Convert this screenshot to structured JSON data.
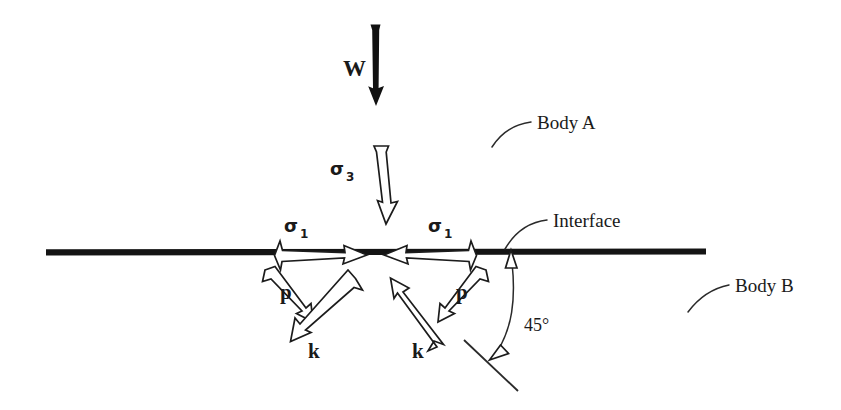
{
  "figure": {
    "background_color": "#ffffff",
    "ink_color": "#1a1a1a"
  },
  "labels": {
    "weight": "W",
    "sigma_symbol": "σ",
    "sigma3_sub": "3",
    "sigma1_sub_left": "1",
    "sigma1_sub_right": "1",
    "p_left": "p",
    "p_right": "p",
    "k_left": "k",
    "k_right": "k",
    "angle": "45°",
    "body_a": "Body A",
    "body_b": "Body B",
    "interface": "Interface"
  },
  "annotations": {
    "body_a_leader": "curved-leader-line",
    "body_b_leader": "curved-leader-line",
    "interface_leader": "curved-leader-line",
    "angle_arc": "double-headed-curved-arc"
  },
  "elements": {
    "weight_arrow": "solid-down-arrow",
    "sigma3_arrow": "hollow-down-arrow",
    "sigma1_left_arrow": "hollow-right-arrow",
    "sigma1_right_arrow": "hollow-left-arrow",
    "p_left_arrow": "hollow-diagonal-arrow",
    "k_left_arrow": "hollow-diagonal-arrow",
    "p_right_arrow": "hollow-diagonal-arrow",
    "k_right_arrow": "hollow-diagonal-arrow",
    "interface_line": "horizontal-rule",
    "slip_plane_line": "slanted-segment"
  }
}
